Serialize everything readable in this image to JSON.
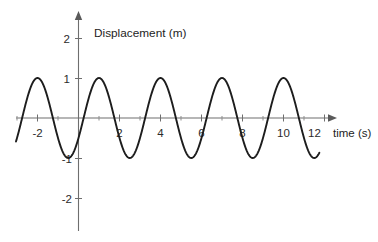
{
  "chart_data": {
    "type": "line",
    "title": "Displacement (m)",
    "xlabel": "time (s)",
    "ylabel": "Displacement (m)",
    "xlim": [
      -3.2,
      12.6
    ],
    "ylim": [
      -2.35,
      2.45
    ],
    "grid": false,
    "legend": "none",
    "x_ticks": [
      {
        "value": -2,
        "label": "-2"
      },
      {
        "value": 0,
        "label": ""
      },
      {
        "value": 2,
        "label": "2"
      },
      {
        "value": 4,
        "label": "4"
      },
      {
        "value": 6,
        "label": "6"
      },
      {
        "value": 8,
        "label": "8"
      },
      {
        "value": 10,
        "label": "10"
      },
      {
        "value": 12,
        "label": "12"
      }
    ],
    "x_minor_ticks": [
      -3,
      -1,
      1,
      3,
      5,
      7,
      9,
      11
    ],
    "y_ticks": [
      {
        "value": 2,
        "label": "2"
      },
      {
        "value": 1,
        "label": "1"
      },
      {
        "value": -1,
        "label": "-1"
      },
      {
        "value": -2,
        "label": "-2"
      }
    ],
    "series": [
      {
        "name": "displacement",
        "color": "#1d1d1d",
        "waveform": "sine",
        "amplitude": 1,
        "period": 3,
        "peak_times": [
          -2.3,
          1,
          4,
          7,
          10
        ],
        "trough_times": [
          -0.8,
          2.5,
          5.5,
          8.5,
          11.5
        ],
        "zero_crossings_rising": [
          -3.5,
          -0.5,
          2.5,
          5.5,
          8.5
        ],
        "x_start": -3.05,
        "x_end": 11.75,
        "x": [
          -3.05,
          -2.8,
          -2.55,
          -2.3,
          -2.05,
          -1.8,
          -1.55,
          -1.3,
          -1.05,
          -0.8,
          -0.55,
          -0.3,
          -0.05,
          0.2,
          0.45,
          0.7,
          0.95,
          1.2,
          1.45,
          1.7,
          1.95,
          2.2,
          2.45,
          2.7,
          2.95,
          3.2,
          3.45,
          3.7,
          3.95,
          4.2,
          4.45,
          4.7,
          4.95,
          5.2,
          5.45,
          5.7,
          5.95,
          6.2,
          6.45,
          6.7,
          6.95,
          7.2,
          7.45,
          7.7,
          7.95,
          8.2,
          8.45,
          8.7,
          8.95,
          9.2,
          9.45,
          9.7,
          9.95,
          10.2,
          10.45,
          10.7,
          10.95,
          11.2,
          11.45,
          11.75
        ],
        "y": [
          0.1,
          0.59,
          0.91,
          1.0,
          0.95,
          0.72,
          0.33,
          -0.12,
          -0.56,
          -0.88,
          -1.0,
          -0.93,
          -0.67,
          -0.29,
          0.15,
          0.58,
          0.87,
          1.0,
          0.94,
          0.7,
          0.31,
          -0.14,
          -0.58,
          -0.89,
          -1.0,
          -0.92,
          -0.65,
          -0.26,
          0.18,
          0.6,
          0.89,
          1.0,
          0.93,
          0.68,
          0.28,
          -0.17,
          -0.6,
          -0.9,
          -1.0,
          -0.91,
          -0.63,
          -0.24,
          0.2,
          0.62,
          0.9,
          1.0,
          0.92,
          0.66,
          0.26,
          -0.19,
          -0.62,
          -0.91,
          -1.0,
          -0.9,
          -0.61,
          -0.21,
          0.23,
          0.64,
          0.91,
          0.99
        ]
      }
    ]
  },
  "labels": {
    "chart_title": "Displacement (m)",
    "x_axis_title": "time (s)",
    "x_tick_neg2": "-2",
    "x_tick_2": "2",
    "x_tick_4": "4",
    "x_tick_6": "6",
    "x_tick_8": "8",
    "x_tick_10": "10",
    "x_tick_12": "12",
    "y_tick_2": "2",
    "y_tick_1": "1",
    "y_tick_neg1": "-1",
    "y_tick_neg2": "-2"
  },
  "colors": {
    "curve": "#1d1d1d",
    "axis": "#6e6e6e",
    "text": "#1d1d1d",
    "background": "#ffffff"
  }
}
